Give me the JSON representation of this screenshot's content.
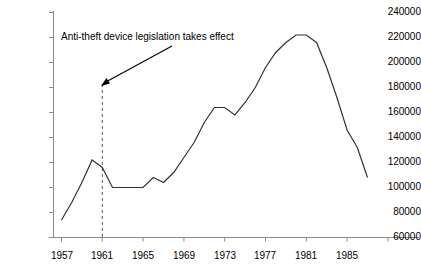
{
  "chart_data": {
    "type": "line",
    "title": "",
    "subtitle": "",
    "xlabel": "",
    "ylabel": "",
    "xlim": [
      1957,
      1987
    ],
    "ylim": [
      60000,
      240000
    ],
    "ytick_labels": [
      "240000",
      "220000",
      "200000",
      "180000",
      "160000",
      "140000",
      "120000",
      "100000",
      "80000",
      "60000"
    ],
    "ytick_values": [
      240000,
      220000,
      200000,
      180000,
      160000,
      140000,
      120000,
      100000,
      80000,
      60000
    ],
    "xtick_labels": [
      "1957",
      "1961",
      "1965",
      "1969",
      "1973",
      "1977",
      "1981",
      "1985"
    ],
    "xtick_values": [
      1957,
      1961,
      1965,
      1969,
      1973,
      1977,
      1981,
      1985
    ],
    "grid": false,
    "legend": false,
    "legend_position": "none",
    "line_color": "#333333",
    "axis_color": "#808080",
    "series": [
      {
        "name": "Motor vehicle thefts",
        "x": [
          1957,
          1958,
          1959,
          1960,
          1961,
          1962,
          1963,
          1964,
          1965,
          1966,
          1967,
          1968,
          1969,
          1970,
          1971,
          1972,
          1973,
          1974,
          1975,
          1976,
          1977,
          1978,
          1979,
          1980,
          1981,
          1982,
          1983,
          1984,
          1985,
          1986,
          1987
        ],
        "values": [
          74000,
          88000,
          104000,
          122000,
          116000,
          100000,
          100000,
          100000,
          100000,
          108000,
          104000,
          112000,
          124000,
          136000,
          152000,
          164000,
          164000,
          158000,
          168000,
          180000,
          196000,
          208000,
          216000,
          222000,
          222000,
          216000,
          196000,
          172000,
          146000,
          132000,
          108000
        ]
      }
    ],
    "annotations": [
      {
        "name": "anti-theft-annotation",
        "text": "Anti-theft device legislation takes effect",
        "marker_year": 1961,
        "marker_style": "dashed-vertical-line",
        "arrow": true
      }
    ]
  },
  "axis_labels": {
    "y": [
      "240000",
      "220000",
      "200000",
      "180000",
      "160000",
      "140000",
      "120000",
      "100000",
      "80000",
      "60000"
    ],
    "x": [
      "1957",
      "1961",
      "1965",
      "1969",
      "1973",
      "1977",
      "1981",
      "1985"
    ]
  },
  "annotation": {
    "text": "Anti-theft device legislation takes effect"
  }
}
